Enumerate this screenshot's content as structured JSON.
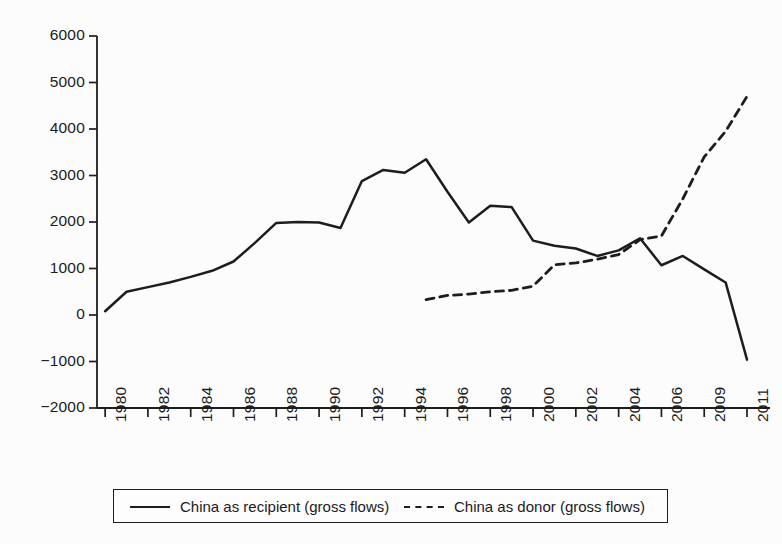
{
  "chart_data": {
    "type": "line",
    "title": "",
    "subtitle": "",
    "xlabel": "",
    "ylabel": "",
    "ylim": [
      -2000,
      6000
    ],
    "ytick_labels": [
      "6000",
      "5000",
      "4000",
      "3000",
      "2000",
      "1000",
      "0",
      "-1000",
      "-2000"
    ],
    "ytick_values": [
      6000,
      5000,
      4000,
      3000,
      2000,
      1000,
      0,
      -1000,
      -2000
    ],
    "xtick_labels": [
      "1980",
      "1982",
      "1984",
      "1986",
      "1988",
      "1990",
      "1992",
      "1994",
      "1996",
      "1998",
      "2000",
      "2002",
      "2004",
      "2006",
      "2009",
      "2011"
    ],
    "grid": false,
    "legend_position": "bottom",
    "x_categories": [
      "1980",
      "1981",
      "1982",
      "1983",
      "1984",
      "1985",
      "1986",
      "1987",
      "1988",
      "1989",
      "1990",
      "1991",
      "1992",
      "1993",
      "1994",
      "1995",
      "1996",
      "1997",
      "1998",
      "1999",
      "2000",
      "2001",
      "2002",
      "2003",
      "2004",
      "2005",
      "2006",
      "2008",
      "2009",
      "2010",
      "2011"
    ],
    "series": [
      {
        "name": "China as recipient (gross flows)",
        "style": "solid",
        "color": "#1d1d1d",
        "x": [
          "1980",
          "1981",
          "1982",
          "1983",
          "1984",
          "1985",
          "1986",
          "1987",
          "1988",
          "1989",
          "1990",
          "1991",
          "1992",
          "1993",
          "1994",
          "1995",
          "1996",
          "1997",
          "1998",
          "1999",
          "2000",
          "2001",
          "2002",
          "2003",
          "2004",
          "2005",
          "2006",
          "2008",
          "2009",
          "2010",
          "2011"
        ],
        "values": [
          80,
          500,
          600,
          700,
          820,
          950,
          1150,
          1550,
          1980,
          2000,
          1990,
          1870,
          2880,
          3120,
          3060,
          3350,
          2650,
          1990,
          2350,
          2320,
          1600,
          1490,
          1430,
          1270,
          1390,
          1650,
          1070,
          1270,
          980,
          700,
          -960
        ]
      },
      {
        "name": "China as donor (gross flows)",
        "style": "dashed",
        "color": "#1d1d1d",
        "x": [
          "1995",
          "1996",
          "1997",
          "1998",
          "1999",
          "2000",
          "2001",
          "2002",
          "2003",
          "2004",
          "2005",
          "2006",
          "2008",
          "2009",
          "2010",
          "2011"
        ],
        "values": [
          330,
          420,
          450,
          500,
          530,
          620,
          1080,
          1120,
          1200,
          1300,
          1620,
          1700,
          2500,
          3400,
          3950,
          4700
        ]
      }
    ]
  },
  "legend": {
    "entries": [
      {
        "label": "China as recipient (gross flows)",
        "style": "solid"
      },
      {
        "label": "China as donor (gross flows)",
        "style": "dashed"
      }
    ]
  }
}
